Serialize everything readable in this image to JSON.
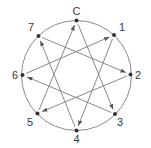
{
  "diagram": {
    "type": "enneagram-style cyclic arrow diagram",
    "circle": {
      "cx": 76.5,
      "cy": 75.5,
      "r": 55,
      "stroke": "#8a8a8a"
    },
    "line_color": "#7a7a7a",
    "node_color": "#333333",
    "label_color": "#3a3a3a",
    "nodes": [
      {
        "id": "C",
        "label": "C",
        "x": 76.5,
        "y": 20.5,
        "lx": 76.5,
        "ly": 15,
        "anchor": "middle"
      },
      {
        "id": "1",
        "label": "1",
        "x": 114,
        "y": 35,
        "lx": 119,
        "ly": 31,
        "anchor": "start"
      },
      {
        "id": "2",
        "label": "2",
        "x": 130.5,
        "y": 74.5,
        "lx": 135,
        "ly": 78.5,
        "anchor": "start"
      },
      {
        "id": "3",
        "label": "3",
        "x": 115,
        "y": 114,
        "lx": 117,
        "ly": 126,
        "anchor": "start"
      },
      {
        "id": "4",
        "label": "4",
        "x": 76.5,
        "y": 130.5,
        "lx": 76.5,
        "ly": 143,
        "anchor": "middle"
      },
      {
        "id": "5",
        "label": "5",
        "x": 37.5,
        "y": 113.5,
        "lx": 33,
        "ly": 126,
        "anchor": "end"
      },
      {
        "id": "6",
        "label": "6",
        "x": 22.5,
        "y": 75,
        "lx": 18,
        "ly": 79,
        "anchor": "end"
      },
      {
        "id": "7",
        "label": "7",
        "x": 38.5,
        "y": 36,
        "lx": 34,
        "ly": 31,
        "anchor": "end"
      }
    ],
    "edges": [
      {
        "from": "C",
        "to": "3"
      },
      {
        "from": "3",
        "to": "6"
      },
      {
        "from": "6",
        "to": "1"
      },
      {
        "from": "1",
        "to": "4"
      },
      {
        "from": "4",
        "to": "7"
      },
      {
        "from": "7",
        "to": "2"
      },
      {
        "from": "2",
        "to": "5"
      },
      {
        "from": "5",
        "to": "C"
      }
    ]
  }
}
